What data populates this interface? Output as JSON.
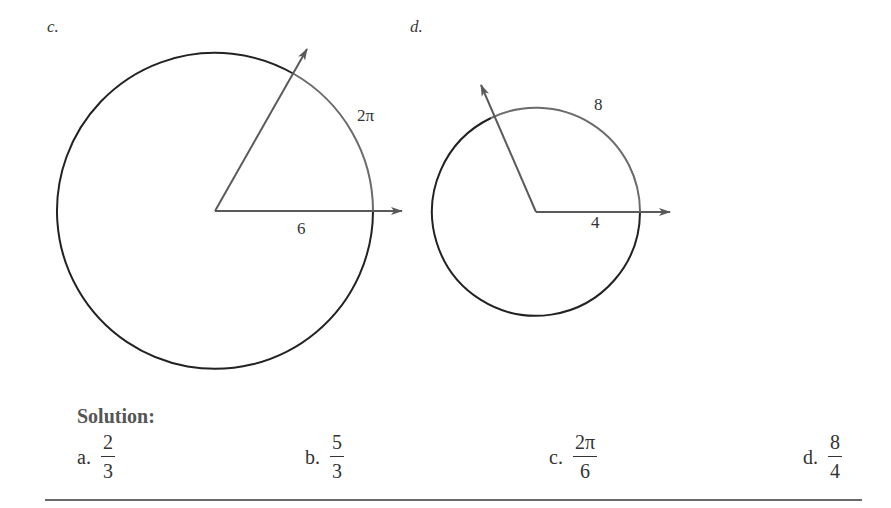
{
  "figures": {
    "c": {
      "label": "c.",
      "arc_label": "2π",
      "radius_label": "6",
      "center": [
        215,
        211
      ],
      "radius": 158,
      "ray_horizontal_end": [
        402,
        211
      ],
      "ray_angled_end": [
        307,
        48
      ],
      "arc_start": [
        294,
        75
      ],
      "arc_end": [
        373,
        211
      ]
    },
    "d": {
      "label": "d.",
      "arc_label": "8",
      "radius_label": "4",
      "center": [
        536,
        212
      ],
      "radius": 104,
      "ray_horizontal_end": [
        670,
        212
      ],
      "ray_angled_end": [
        480,
        84
      ],
      "arc_start": [
        490,
        118
      ],
      "arc_end": [
        640,
        212
      ]
    }
  },
  "colors": {
    "circle_stroke": "#222222",
    "subtended_arc": "#6b6b6b",
    "ray": "#5a5a5a",
    "heading": "#555555",
    "rule": "#6a6a6a"
  },
  "solution": {
    "heading": "Solution:",
    "answers": [
      {
        "letter": "a.",
        "numerator": "2",
        "denominator": "3"
      },
      {
        "letter": "b.",
        "numerator": "5",
        "denominator": "3"
      },
      {
        "letter": "c.",
        "numerator": "2π",
        "denominator": "6"
      },
      {
        "letter": "d.",
        "numerator": "8",
        "denominator": "4"
      }
    ]
  }
}
